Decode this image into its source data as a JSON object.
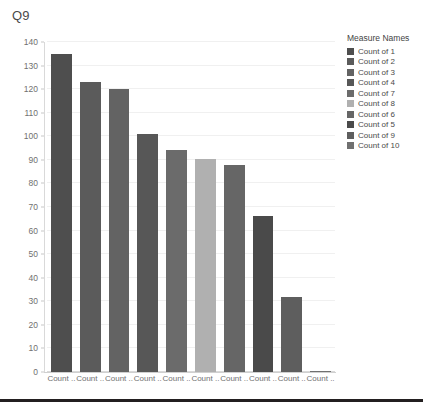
{
  "title": "Q9",
  "legend": {
    "title": "Measure Names",
    "items": [
      {
        "label": "Count of 1",
        "color": "#4e4e4e"
      },
      {
        "label": "Count of 2",
        "color": "#5b5b5b"
      },
      {
        "label": "Count of 3",
        "color": "#636363"
      },
      {
        "label": "Count of 4",
        "color": "#575757"
      },
      {
        "label": "Count of 7",
        "color": "#6b6b6b"
      },
      {
        "label": "Count of 8",
        "color": "#b0b0b0"
      },
      {
        "label": "Count of 6",
        "color": "#666666"
      },
      {
        "label": "Count of 5",
        "color": "#4a4a4a"
      },
      {
        "label": "Count of 9",
        "color": "#5e5e5e"
      },
      {
        "label": "Count of 10",
        "color": "#707070"
      }
    ]
  },
  "chart_data": {
    "type": "bar",
    "title": "Q9",
    "xlabel": "",
    "ylabel": "Value",
    "ylim": [
      0,
      140
    ],
    "ytick_step": 10,
    "yticks": [
      0,
      10,
      20,
      30,
      40,
      50,
      60,
      70,
      80,
      90,
      100,
      110,
      120,
      130,
      140
    ],
    "grid": true,
    "legend_position": "right",
    "categories": [
      "Count ..",
      "Count ..",
      "Count ..",
      "Count ..",
      "Count ..",
      "Count ..",
      "Count ..",
      "Count ..",
      "Count ..",
      "Count .."
    ],
    "series_names": [
      "Count of 1",
      "Count of 2",
      "Count of 3",
      "Count of 4",
      "Count of 7",
      "Count of 8",
      "Count of 6",
      "Count of 5",
      "Count of 9",
      "Count of 10"
    ],
    "values": [
      135,
      123,
      120,
      101,
      94,
      90.5,
      88,
      66,
      32,
      0.5
    ],
    "colors": [
      "#4e4e4e",
      "#5b5b5b",
      "#636363",
      "#575757",
      "#6b6b6b",
      "#b0b0b0",
      "#666666",
      "#4a4a4a",
      "#5e5e5e",
      "#707070"
    ]
  }
}
